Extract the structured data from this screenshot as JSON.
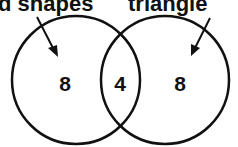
{
  "title": {
    "left_fragment": "d shapes",
    "right_fragment": "triangle"
  },
  "venn": {
    "sets": [
      {
        "name": "left-circle",
        "only_count": "8"
      },
      {
        "name": "right-circle",
        "only_count": "8"
      }
    ],
    "intersection_count": "4",
    "stroke_color": "#111111",
    "background": "#ffffff"
  },
  "arrows": [
    {
      "name": "left-arrow",
      "points_to": "left-circle"
    },
    {
      "name": "right-arrow",
      "points_to": "right-circle"
    }
  ]
}
